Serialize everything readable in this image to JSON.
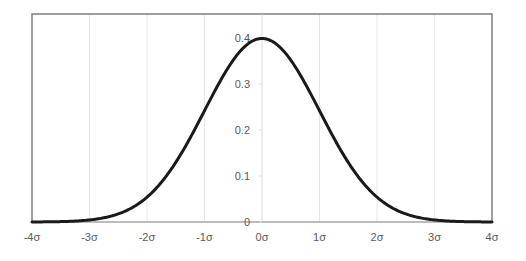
{
  "chart_data": {
    "type": "line",
    "title": "",
    "xlabel": "",
    "ylabel": "",
    "x_tick_labels": [
      "-4σ",
      "-3σ",
      "-2σ",
      "-1σ",
      "0σ",
      "1σ",
      "2σ",
      "3σ",
      "4σ"
    ],
    "x_ticks": [
      -4,
      -3,
      -2,
      -1,
      0,
      1,
      2,
      3,
      4
    ],
    "y_tick_labels": [
      "0",
      "0.1",
      "0.2",
      "0.3",
      "0.4"
    ],
    "y_ticks": [
      0,
      0.1,
      0.2,
      0.3,
      0.4
    ],
    "xlim": [
      -4,
      4
    ],
    "ylim": [
      0,
      0.4
    ],
    "grid": {
      "vertical": true,
      "horizontal": false
    },
    "legend": null,
    "series": [
      {
        "name": "N(0,1) density",
        "color": "#1a1a1a",
        "x": [
          -4,
          -3.5,
          -3,
          -2.5,
          -2,
          -1.5,
          -1,
          -0.5,
          0,
          0.5,
          1,
          1.5,
          2,
          2.5,
          3,
          3.5,
          4
        ],
        "values": [
          0.0001,
          0.0009,
          0.0044,
          0.0175,
          0.054,
          0.1295,
          0.242,
          0.3521,
          0.3989,
          0.3521,
          0.242,
          0.1295,
          0.054,
          0.0175,
          0.0044,
          0.0009,
          0.0001
        ]
      }
    ]
  },
  "colors": {
    "curve": "#1a1a1a",
    "frame": "#7f7f7f",
    "gridline": "#e6e6e6",
    "axis": "#d9d9d9",
    "tick_text": "#595959"
  }
}
